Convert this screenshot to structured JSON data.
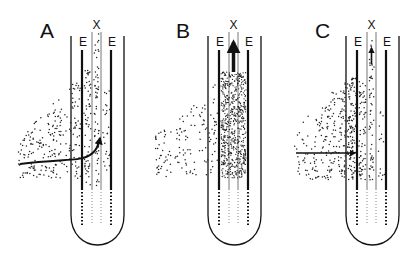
{
  "figure": {
    "colors": {
      "ink": "#111111",
      "background": "#ffffff"
    },
    "panels": [
      {
        "id": "A",
        "letter": "A",
        "labels": {
          "left_band": "E",
          "center": "X",
          "right_band": "E"
        },
        "arrow": "curved arrow from left cortex bending upward into xylem",
        "particles": "sparse in cortex and stele"
      },
      {
        "id": "B",
        "letter": "B",
        "labels": {
          "left_band": "E",
          "center": "X",
          "right_band": "E"
        },
        "arrow": "thick upward arrow in xylem",
        "particles": "dense inside stele, sparse outside"
      },
      {
        "id": "C",
        "letter": "C",
        "labels": {
          "left_band": "E",
          "center": "X",
          "right_band": "E"
        },
        "arrow": "horizontal arrow to endodermis and short upward arrow in xylem",
        "particles": "accumulated outside endodermis"
      }
    ]
  }
}
